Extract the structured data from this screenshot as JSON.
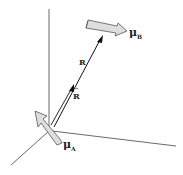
{
  "diagram": {
    "labels": {
      "mu_b": "μ",
      "mu_b_sub": "B",
      "mu_a": "μ",
      "mu_a_sub": "A",
      "r_vector": "R",
      "r_unit": "R",
      "r_unit_hat": "^"
    },
    "colors": {
      "axis": "#333333",
      "arrow_fill": "#d9d9d9",
      "arrow_stroke": "#555555",
      "vector": "#111111"
    }
  }
}
